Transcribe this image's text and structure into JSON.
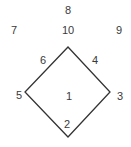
{
  "diagram": {
    "type": "diamond-with-numbered-labels",
    "shape": {
      "name": "diamond",
      "vertices": {
        "top": [
          68,
          47
        ],
        "right": [
          110,
          92
        ],
        "bottom": [
          68,
          137
        ],
        "left": [
          25,
          92
        ]
      },
      "stroke": "#333333",
      "stroke_width": 1.3
    },
    "labels": [
      {
        "id": "8",
        "text": "8",
        "x": 68,
        "y": 10
      },
      {
        "id": "7",
        "text": "7",
        "x": 14,
        "y": 30
      },
      {
        "id": "10",
        "text": "10",
        "x": 68,
        "y": 30
      },
      {
        "id": "9",
        "text": "9",
        "x": 119,
        "y": 30
      },
      {
        "id": "6",
        "text": "6",
        "x": 43,
        "y": 60
      },
      {
        "id": "4",
        "text": "4",
        "x": 95,
        "y": 60
      },
      {
        "id": "5",
        "text": "5",
        "x": 19,
        "y": 95
      },
      {
        "id": "1",
        "text": "1",
        "x": 69,
        "y": 96
      },
      {
        "id": "3",
        "text": "3",
        "x": 120,
        "y": 96
      },
      {
        "id": "2",
        "text": "2",
        "x": 67,
        "y": 124
      }
    ]
  }
}
